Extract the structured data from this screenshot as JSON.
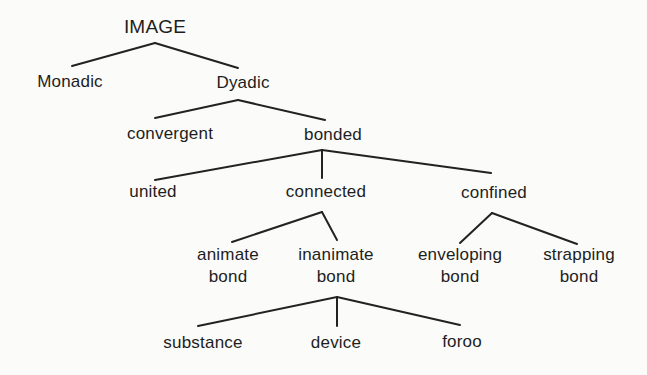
{
  "diagram": {
    "type": "tree",
    "nodes": {
      "root": {
        "label": "IMAGE"
      },
      "monadic": {
        "label": "Monadic"
      },
      "dyadic": {
        "label": "Dyadic"
      },
      "convergent": {
        "label": "convergent"
      },
      "bonded": {
        "label": "bonded"
      },
      "united": {
        "label": "united"
      },
      "connected": {
        "label": "connected"
      },
      "confined": {
        "label": "confined"
      },
      "animate_bond": {
        "line1": "animate",
        "line2": "bond"
      },
      "inanimate_bond": {
        "line1": "inanimate",
        "line2": "bond"
      },
      "enveloping_bond": {
        "line1": "enveloping",
        "line2": "bond"
      },
      "strapping_bond": {
        "line1": "strapping",
        "line2": "bond"
      },
      "substance": {
        "label": "substance"
      },
      "device": {
        "label": "device"
      },
      "force": {
        "label": "foroo"
      }
    },
    "edges": [
      [
        "IMAGE",
        "Monadic"
      ],
      [
        "IMAGE",
        "Dyadic"
      ],
      [
        "Dyadic",
        "convergent"
      ],
      [
        "Dyadic",
        "bonded"
      ],
      [
        "bonded",
        "united"
      ],
      [
        "bonded",
        "connected"
      ],
      [
        "bonded",
        "confined"
      ],
      [
        "connected",
        "animate bond"
      ],
      [
        "connected",
        "inanimate bond"
      ],
      [
        "confined",
        "enveloping bond"
      ],
      [
        "confined",
        "strapping bond"
      ],
      [
        "inanimate bond",
        "substance"
      ],
      [
        "inanimate bond",
        "device"
      ],
      [
        "inanimate bond",
        "foroo"
      ]
    ]
  }
}
